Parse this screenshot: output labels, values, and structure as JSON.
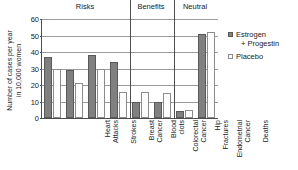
{
  "chart_data": {
    "type": "bar",
    "title": "",
    "xlabel": "",
    "ylabel": "Number of cases per year in 10,000 women",
    "ylim": [
      0,
      60
    ],
    "yticks": [
      0,
      10,
      20,
      30,
      40,
      50,
      60
    ],
    "grid": true,
    "legend_position": "right",
    "categories": [
      "Heart Attacks",
      "Strokes",
      "Breast Cancer",
      "Blood clots",
      "Colorectal Cancer",
      "Hip Fractures",
      "Endometrial Cancer",
      "Deaths"
    ],
    "series": [
      {
        "name": "Estrogen + Progestin",
        "values": [
          37,
          29,
          38,
          34,
          10,
          10,
          4,
          51
        ]
      },
      {
        "name": "Placebo",
        "values": [
          30,
          21,
          30,
          16,
          16,
          15,
          5,
          52
        ]
      }
    ],
    "groups": [
      {
        "label": "Risks",
        "categories": [
          "Heart Attacks",
          "Strokes",
          "Breast Cancer",
          "Blood clots"
        ]
      },
      {
        "label": "Benefits",
        "categories": [
          "Colorectal Cancer",
          "Hip Fractures"
        ]
      },
      {
        "label": "Neutral",
        "categories": [
          "Endometrial Cancer",
          "Deaths"
        ]
      }
    ],
    "colors": {
      "treatment": "#808080",
      "control": "#ffffff",
      "axis": "#4d4d4d",
      "grid": "#9a9a9a"
    }
  },
  "axis": {
    "y_title_line1": "Number of cases per year",
    "y_title_line2": "in 10,000 women",
    "tick_0": "0",
    "tick_10": "10",
    "tick_20": "20",
    "tick_30": "30",
    "tick_40": "40",
    "tick_50": "50",
    "tick_60": "60"
  },
  "groups": {
    "risks": "Risks",
    "benefits": "Benefits",
    "neutral": "Neutral"
  },
  "categories": {
    "heart_attacks_l1": "Heart",
    "heart_attacks_l2": "Attacks",
    "strokes_l1": "Strokes",
    "breast_cancer_l1": "Breast",
    "breast_cancer_l2": "Cancer",
    "blood_clots_l1": "Blood",
    "blood_clots_l2": "clots",
    "colorectal_l1": "Colorectal",
    "colorectal_l2": "Cancer",
    "hip_fractures_l1": "Hip",
    "hip_fractures_l2": "Fractures",
    "endometrial_l1": "Endometrial",
    "endometrial_l2": "Cancer",
    "deaths_l1": "Deaths"
  },
  "legend": {
    "treatment_l1": "Estrogen",
    "treatment_l2": "+ Progestin",
    "control_l1": "Placebo"
  }
}
